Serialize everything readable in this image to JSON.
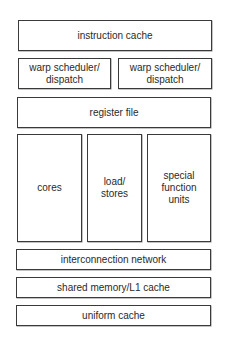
{
  "diagram": {
    "title": "",
    "blocks": {
      "instruction_cache": "instruction cache",
      "warp_scheduler_1": "warp scheduler/\ndispatch",
      "warp_scheduler_2": "warp scheduler/\ndispatch",
      "register_file": "register file",
      "cores": "cores",
      "load_stores": "load/\nstores",
      "special_function_units": "special\nfunction\nunits",
      "interconnection_network": "interconnection network",
      "shared_memory": "shared memory/L1 cache",
      "uniform_cache": "uniform cache"
    },
    "colors": {
      "border": "#3a3a3a",
      "background": "#ffffff",
      "text": "#2a2a2a"
    }
  }
}
